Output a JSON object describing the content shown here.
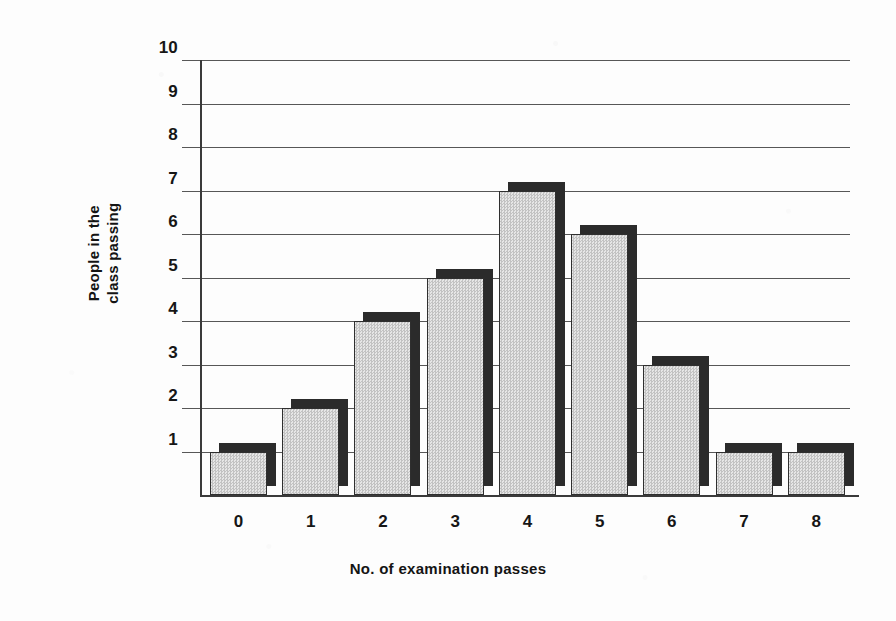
{
  "chart_data": {
    "type": "bar",
    "title": "",
    "subtitle": "",
    "xlabel": "No. of examination passes",
    "ylabel": "People in the class passing",
    "ylabel_lines": [
      "People in the",
      "class passing"
    ],
    "categories": [
      "0",
      "1",
      "2",
      "3",
      "4",
      "5",
      "6",
      "7",
      "8"
    ],
    "values": [
      1,
      2,
      4,
      5,
      7,
      6,
      3,
      1,
      1
    ],
    "series": [
      {
        "name": "People in the class passing",
        "values": [
          1,
          2,
          4,
          5,
          7,
          6,
          3,
          1,
          1
        ]
      }
    ],
    "ytick_labels": [
      "1",
      "2",
      "3",
      "4",
      "5",
      "6",
      "7",
      "8",
      "9",
      "10"
    ],
    "ylim": [
      0,
      10
    ],
    "ytick_step": 1,
    "grid": true,
    "grid_axis": "y",
    "legend": "none",
    "style": "3d-bar",
    "colors": {
      "bar_face": "#d9d9d9",
      "bar_shadow": "#2b2b2b",
      "bar_outline": "#2f2f2f",
      "gridline": "#575757",
      "axis": "#3a3a3a",
      "text": "#161616",
      "background": "#fdfdfd"
    }
  }
}
